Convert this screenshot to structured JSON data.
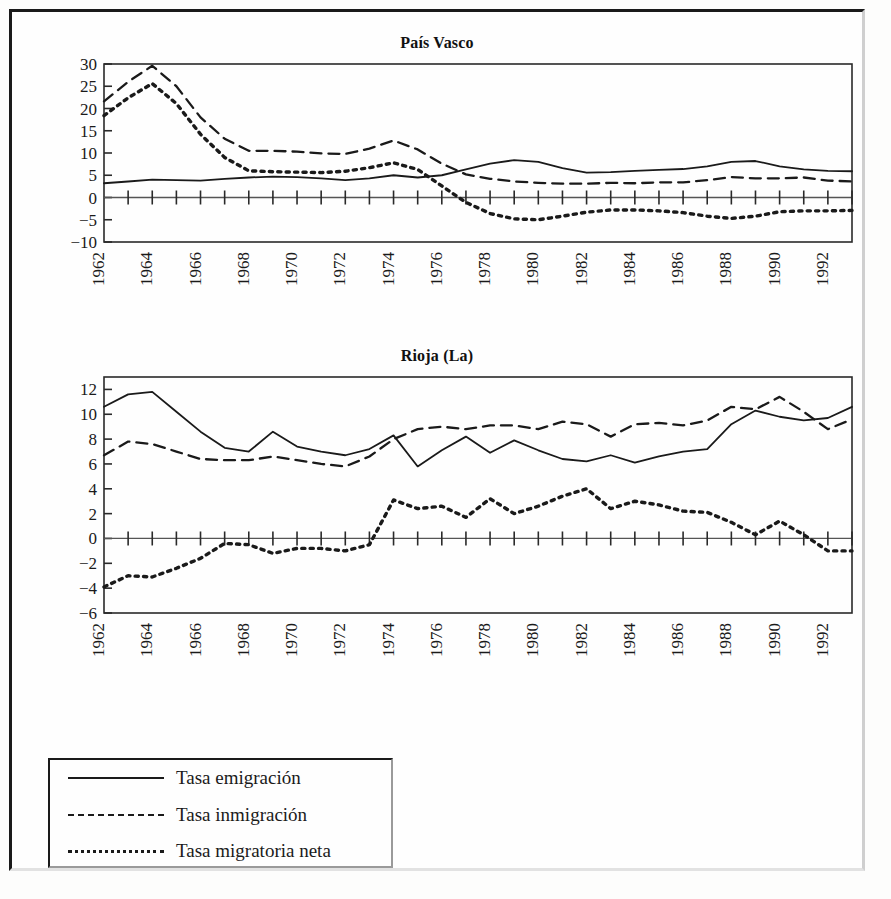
{
  "figure": {
    "background_color": "#fefefe",
    "line_color": "#1a1a1a"
  },
  "legend": {
    "name": "series-legend",
    "items": [
      {
        "label": "Tasa emigración",
        "style": "solid",
        "key": "emigracion"
      },
      {
        "label": "Tasa inmigración",
        "style": "dashed",
        "key": "inmigracion"
      },
      {
        "label": "Tasa migratoria neta",
        "style": "dotted",
        "key": "neta"
      }
    ]
  },
  "chart_data": [
    {
      "id": "pais-vasco",
      "type": "line",
      "title": "País Vasco",
      "xlabel": "",
      "ylabel": "",
      "xlim": [
        1962,
        1993
      ],
      "ylim": [
        -10,
        30
      ],
      "yticks": [
        30,
        25,
        20,
        15,
        10,
        5,
        0,
        -5,
        -10
      ],
      "ytick_labels": [
        "30",
        "25",
        "20",
        "15",
        "10",
        "5",
        "0",
        "-5",
        "-10"
      ],
      "x": [
        1962,
        1963,
        1964,
        1965,
        1966,
        1967,
        1968,
        1969,
        1970,
        1971,
        1972,
        1973,
        1974,
        1975,
        1976,
        1977,
        1978,
        1979,
        1980,
        1981,
        1982,
        1983,
        1984,
        1985,
        1986,
        1987,
        1988,
        1989,
        1990,
        1991,
        1992,
        1993
      ],
      "xtick_labels": [
        "1962",
        "",
        "1964",
        "",
        "1966",
        "",
        "1968",
        "",
        "1970",
        "",
        "1972",
        "",
        "1974",
        "",
        "1976",
        "",
        "1978",
        "",
        "1980",
        "",
        "1982",
        "",
        "1984",
        "",
        "1986",
        "",
        "1988",
        "",
        "1990",
        "",
        "1992",
        ""
      ],
      "grid": false,
      "legend_position": "below-figure",
      "series": [
        {
          "name": "Tasa emigración",
          "style": "solid",
          "values": [
            3.2,
            3.6,
            4.0,
            3.9,
            3.8,
            4.2,
            4.5,
            4.7,
            4.6,
            4.3,
            3.9,
            4.3,
            5.0,
            4.5,
            5.0,
            6.3,
            7.6,
            8.4,
            8.0,
            6.6,
            5.6,
            5.7,
            6.0,
            6.2,
            6.4,
            7.0,
            8.0,
            8.2,
            7.0,
            6.3,
            6.0,
            5.9
          ]
        },
        {
          "name": "Tasa inmigración",
          "style": "dashed",
          "values": [
            21.6,
            26.0,
            29.6,
            25.0,
            18.0,
            13.2,
            10.5,
            10.5,
            10.3,
            9.9,
            9.8,
            11.0,
            12.8,
            10.8,
            7.6,
            5.2,
            4.2,
            3.6,
            3.3,
            3.1,
            3.1,
            3.3,
            3.2,
            3.4,
            3.4,
            3.9,
            4.6,
            4.3,
            4.3,
            4.5,
            3.8,
            3.6
          ]
        },
        {
          "name": "Tasa migratoria neta",
          "style": "dotted",
          "values": [
            18.4,
            22.4,
            25.6,
            21.1,
            14.2,
            9.0,
            6.0,
            5.8,
            5.7,
            5.6,
            5.9,
            6.7,
            7.8,
            6.3,
            2.6,
            -1.1,
            -3.6,
            -4.8,
            -5.0,
            -4.2,
            -3.3,
            -2.8,
            -2.8,
            -3.0,
            -3.4,
            -4.2,
            -4.7,
            -4.2,
            -3.2,
            -3.0,
            -3.0,
            -2.9
          ]
        }
      ]
    },
    {
      "id": "rioja-la",
      "type": "line",
      "title": "Rioja (La)",
      "xlabel": "",
      "ylabel": "",
      "xlim": [
        1962,
        1993
      ],
      "ylim": [
        -6,
        13
      ],
      "yticks": [
        12,
        10,
        8,
        6,
        4,
        2,
        0,
        -2,
        -4,
        -6
      ],
      "ytick_labels": [
        "12",
        "10",
        "8",
        "6",
        "4",
        "2",
        "0",
        "-2",
        "-4",
        "-6"
      ],
      "x": [
        1962,
        1963,
        1964,
        1965,
        1966,
        1967,
        1968,
        1969,
        1970,
        1971,
        1972,
        1973,
        1974,
        1975,
        1976,
        1977,
        1978,
        1979,
        1980,
        1981,
        1982,
        1983,
        1984,
        1985,
        1986,
        1987,
        1988,
        1989,
        1990,
        1991,
        1992,
        1993
      ],
      "xtick_labels": [
        "1962",
        "",
        "1964",
        "",
        "1966",
        "",
        "1968",
        "",
        "1970",
        "",
        "1972",
        "",
        "1974",
        "",
        "1976",
        "",
        "1978",
        "",
        "1980",
        "",
        "1982",
        "",
        "1984",
        "",
        "1986",
        "",
        "1988",
        "",
        "1990",
        "",
        "1992",
        ""
      ],
      "grid": false,
      "legend_position": "below-figure",
      "series": [
        {
          "name": "Tasa emigración",
          "style": "solid",
          "values": [
            10.6,
            11.6,
            11.8,
            10.2,
            8.6,
            7.3,
            7.0,
            8.6,
            7.4,
            7.0,
            6.7,
            7.2,
            8.3,
            5.8,
            7.1,
            8.2,
            6.9,
            7.9,
            7.1,
            6.4,
            6.2,
            6.7,
            6.1,
            6.6,
            7.0,
            7.2,
            9.2,
            10.3,
            9.8,
            9.5,
            9.7,
            10.6
          ]
        },
        {
          "name": "Tasa inmigración",
          "style": "dashed",
          "values": [
            6.7,
            7.8,
            7.6,
            7.0,
            6.4,
            6.3,
            6.3,
            6.6,
            6.3,
            6.0,
            5.8,
            6.6,
            8.0,
            8.8,
            9.0,
            8.8,
            9.1,
            9.1,
            8.8,
            9.4,
            9.2,
            8.2,
            9.2,
            9.3,
            9.1,
            9.5,
            10.6,
            10.4,
            11.4,
            10.2,
            8.8,
            9.6
          ]
        },
        {
          "name": "Tasa migratoria neta",
          "style": "dotted",
          "values": [
            -3.9,
            -3.0,
            -3.1,
            -2.4,
            -1.6,
            -0.4,
            -0.5,
            -1.2,
            -0.8,
            -0.8,
            -1.0,
            -0.5,
            3.1,
            2.4,
            2.6,
            1.7,
            3.2,
            2.0,
            2.6,
            3.4,
            4.0,
            2.4,
            3.0,
            2.7,
            2.2,
            2.1,
            1.3,
            0.3,
            1.4,
            0.3,
            -1.0,
            -1.0
          ]
        }
      ]
    }
  ]
}
